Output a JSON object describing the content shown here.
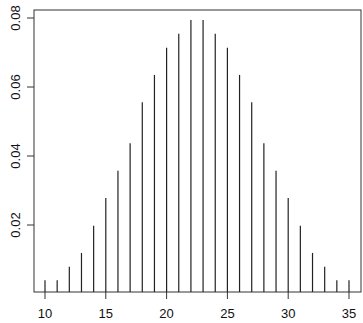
{
  "chart_data": {
    "type": "bar",
    "style": "histogram-lines",
    "title": "",
    "xlabel": "",
    "ylabel": "",
    "x": [
      10,
      11,
      12,
      13,
      14,
      15,
      16,
      17,
      18,
      19,
      20,
      21,
      22,
      23,
      24,
      25,
      26,
      27,
      28,
      29,
      30,
      31,
      32,
      33,
      34,
      35
    ],
    "values": [
      0.004,
      0.004,
      0.0079,
      0.0119,
      0.0198,
      0.0278,
      0.0357,
      0.0437,
      0.0556,
      0.0635,
      0.0714,
      0.0754,
      0.0794,
      0.0794,
      0.0754,
      0.0714,
      0.0635,
      0.0556,
      0.0437,
      0.0357,
      0.0278,
      0.0198,
      0.0119,
      0.0079,
      0.004,
      0.004
    ],
    "x_ticks": [
      "10",
      "15",
      "20",
      "25",
      "30",
      "35"
    ],
    "y_ticks": [
      "0.02",
      "0.04",
      "0.06",
      "0.08"
    ],
    "xlim": [
      9,
      36
    ],
    "ylim": [
      0,
      0.082
    ],
    "grid": false,
    "legend": null
  },
  "colors": {
    "line": "#222222",
    "axis": "#333333",
    "background": "#ffffff"
  }
}
